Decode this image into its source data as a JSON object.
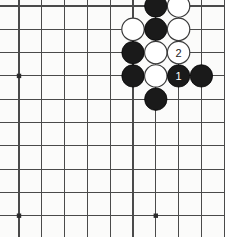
{
  "diagram": {
    "board": {
      "columns": 10,
      "rows": 10,
      "origin_x": 19,
      "origin_y": 6,
      "spacing_x": 22.8,
      "spacing_y": 23.3,
      "line_color": "#4a4a4a",
      "background_color": "#fbfbfa",
      "stone_radius": 11.2
    },
    "star_points": [
      {
        "col": 0,
        "row": 3
      },
      {
        "col": 0,
        "row": 9
      },
      {
        "col": 6,
        "row": 9
      }
    ],
    "stones": [
      {
        "col": 6,
        "row": 0,
        "color": "black",
        "label": ""
      },
      {
        "col": 7,
        "row": 0,
        "color": "white",
        "label": ""
      },
      {
        "col": 5,
        "row": 1,
        "color": "white",
        "label": ""
      },
      {
        "col": 6,
        "row": 1,
        "color": "black",
        "label": ""
      },
      {
        "col": 7,
        "row": 1,
        "color": "white",
        "label": ""
      },
      {
        "col": 5,
        "row": 2,
        "color": "black",
        "label": ""
      },
      {
        "col": 6,
        "row": 2,
        "color": "white",
        "label": ""
      },
      {
        "col": 7,
        "row": 2,
        "color": "white",
        "label": "2"
      },
      {
        "col": 5,
        "row": 3,
        "color": "black",
        "label": ""
      },
      {
        "col": 6,
        "row": 3,
        "color": "white",
        "label": ""
      },
      {
        "col": 7,
        "row": 3,
        "color": "black",
        "label": "1"
      },
      {
        "col": 8,
        "row": 3,
        "color": "black",
        "label": ""
      },
      {
        "col": 6,
        "row": 4,
        "color": "black",
        "label": ""
      }
    ],
    "move_labels": [
      {
        "number": "1",
        "color": "black"
      },
      {
        "number": "2",
        "color": "white"
      }
    ],
    "colors": {
      "black_stone": "#1a1a1a",
      "white_stone": "#ffffff",
      "white_stone_outline": "#3a3a3a",
      "grid": "#4a4a4a",
      "star": "#2b2b2b"
    }
  }
}
